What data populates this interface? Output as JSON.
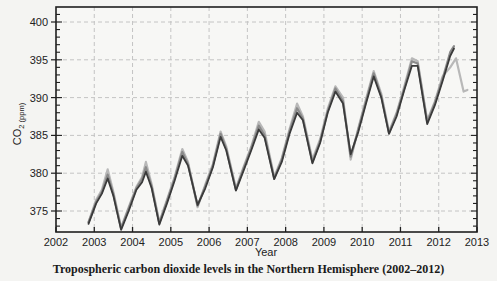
{
  "chart_data": {
    "type": "line",
    "title": "Tropospheric carbon dioxide levels in the Northern Hemisphere (2002–2012)",
    "xlabel": "Year",
    "ylabel": "CO2 (ppm)",
    "ylabel_main": "CO",
    "ylabel_sub": "2 (ppm)",
    "xlim": [
      2002,
      2013
    ],
    "ylim": [
      372,
      402
    ],
    "xticks": [
      2002,
      2003,
      2004,
      2005,
      2006,
      2007,
      2008,
      2009,
      2010,
      2011,
      2012,
      2013
    ],
    "yticks": [
      375,
      380,
      385,
      390,
      395,
      400
    ],
    "grid": true,
    "legend": null,
    "series": [
      {
        "name": "light-gray series",
        "color": "#b8b8b8",
        "x": [
          2002.85,
          2003.05,
          2003.2,
          2003.35,
          2003.5,
          2003.7,
          2003.9,
          2004.1,
          2004.25,
          2004.35,
          2004.5,
          2004.7,
          2004.9,
          2005.1,
          2005.3,
          2005.45,
          2005.7,
          2005.9,
          2006.1,
          2006.3,
          2006.45,
          2006.7,
          2006.9,
          2007.1,
          2007.3,
          2007.45,
          2007.7,
          2007.9,
          2008.1,
          2008.3,
          2008.45,
          2008.7,
          2008.9,
          2009.1,
          2009.3,
          2009.5,
          2009.7,
          2009.9,
          2010.1,
          2010.3,
          2010.5,
          2010.7,
          2010.9,
          2011.1,
          2011.3,
          2011.45,
          2011.7,
          2011.9,
          2012.1,
          2012.3,
          2012.45,
          2012.65,
          2012.75
        ],
        "values": [
          373.5,
          376.5,
          377.8,
          380.5,
          377.5,
          372.8,
          375.5,
          378.2,
          379.5,
          381.5,
          378.5,
          373.5,
          376.5,
          379.5,
          383.2,
          381.5,
          375.5,
          378.5,
          381.2,
          385.5,
          383.5,
          378.0,
          380.8,
          383.5,
          386.8,
          385.5,
          379.5,
          382.0,
          385.8,
          389.2,
          387.5,
          381.8,
          384.5,
          388.5,
          391.5,
          390.0,
          381.8,
          386.0,
          389.8,
          393.5,
          390.5,
          385.5,
          388.0,
          391.5,
          395.2,
          394.8,
          387.0,
          389.5,
          392.8,
          394.0,
          395.2,
          390.8,
          391.0
        ]
      },
      {
        "name": "medium-gray series",
        "color": "#8a8a8a",
        "x": [
          2002.85,
          2003.05,
          2003.2,
          2003.35,
          2003.5,
          2003.7,
          2003.9,
          2004.1,
          2004.25,
          2004.35,
          2004.5,
          2004.7,
          2004.9,
          2005.1,
          2005.3,
          2005.45,
          2005.7,
          2005.9,
          2006.1,
          2006.3,
          2006.45,
          2006.7,
          2006.9,
          2007.1,
          2007.3,
          2007.45,
          2007.7,
          2007.9,
          2008.1,
          2008.3,
          2008.45,
          2008.7,
          2008.9,
          2009.1,
          2009.3,
          2009.5,
          2009.7,
          2009.9,
          2010.1,
          2010.3,
          2010.5,
          2010.7,
          2010.9,
          2011.1,
          2011.3,
          2011.45,
          2011.7,
          2011.9,
          2012.1,
          2012.3,
          2012.4
        ],
        "values": [
          373.5,
          376.2,
          377.5,
          379.8,
          377.2,
          372.7,
          375.3,
          378.0,
          379.2,
          380.8,
          378.2,
          373.4,
          376.3,
          379.3,
          382.8,
          381.2,
          375.7,
          378.3,
          381.0,
          385.2,
          383.2,
          377.8,
          380.6,
          383.3,
          386.3,
          385.0,
          379.3,
          381.8,
          385.5,
          388.6,
          387.2,
          381.5,
          384.2,
          388.2,
          391.2,
          389.5,
          382.2,
          385.8,
          389.5,
          393.2,
          390.2,
          385.3,
          387.8,
          391.2,
          394.8,
          394.5,
          386.8,
          389.3,
          392.5,
          396.0,
          396.8
        ]
      },
      {
        "name": "dark series",
        "color": "#3a3a3a",
        "x": [
          2002.85,
          2003.05,
          2003.2,
          2003.35,
          2003.5,
          2003.7,
          2003.9,
          2004.1,
          2004.25,
          2004.35,
          2004.5,
          2004.7,
          2004.9,
          2005.1,
          2005.3,
          2005.45,
          2005.7,
          2005.9,
          2006.1,
          2006.3,
          2006.45,
          2006.7,
          2006.9,
          2007.1,
          2007.3,
          2007.45,
          2007.7,
          2007.9,
          2008.1,
          2008.3,
          2008.45,
          2008.7,
          2008.9,
          2009.1,
          2009.3,
          2009.5,
          2009.7,
          2009.9,
          2010.1,
          2010.3,
          2010.5,
          2010.7,
          2010.9,
          2011.1,
          2011.3,
          2011.45,
          2011.7,
          2011.9,
          2012.1,
          2012.3,
          2012.4
        ],
        "values": [
          373.3,
          376.0,
          377.3,
          379.3,
          377.0,
          372.5,
          375.0,
          377.8,
          378.8,
          380.2,
          378.0,
          373.2,
          376.0,
          379.0,
          382.3,
          381.0,
          375.8,
          378.0,
          380.8,
          384.8,
          383.0,
          377.7,
          380.3,
          383.0,
          385.8,
          384.7,
          379.2,
          381.5,
          385.2,
          388.0,
          387.0,
          381.3,
          384.0,
          388.0,
          390.8,
          389.2,
          382.5,
          385.5,
          389.2,
          392.8,
          390.0,
          385.2,
          387.5,
          391.0,
          394.2,
          394.2,
          386.5,
          389.0,
          392.2,
          395.5,
          396.5
        ]
      }
    ]
  }
}
